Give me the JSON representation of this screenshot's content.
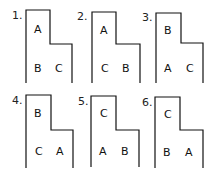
{
  "diagram": {
    "panels": [
      {
        "number": "1.",
        "top": "A",
        "bottom_left": "B",
        "bottom_right": "C",
        "x": 26,
        "y": 10,
        "stepx": 50,
        "stepy": 44,
        "right": 72,
        "bottom": 83
      },
      {
        "number": "2.",
        "top": "A",
        "bottom_left": "C",
        "bottom_right": "B",
        "x": 92,
        "y": 12,
        "stepx": 116,
        "stepy": 44,
        "right": 140,
        "bottom": 83
      },
      {
        "number": "3.",
        "top": "B",
        "bottom_left": "A",
        "bottom_right": "C",
        "x": 156,
        "y": 13,
        "stepx": 181,
        "stepy": 43,
        "right": 203,
        "bottom": 83
      },
      {
        "number": "4.",
        "top": "B",
        "bottom_left": "C",
        "bottom_right": "A",
        "x": 26,
        "y": 95,
        "stepx": 51,
        "stepy": 130,
        "right": 73,
        "bottom": 168
      },
      {
        "number": "5.",
        "top": "C",
        "bottom_left": "A",
        "bottom_right": "B",
        "x": 91,
        "y": 96,
        "stepx": 116,
        "stepy": 130,
        "right": 139,
        "bottom": 167
      },
      {
        "number": "6.",
        "top": "C",
        "bottom_left": "B",
        "bottom_right": "A",
        "x": 155,
        "y": 97,
        "stepx": 180,
        "stepy": 130,
        "right": 203,
        "bottom": 168
      }
    ]
  }
}
